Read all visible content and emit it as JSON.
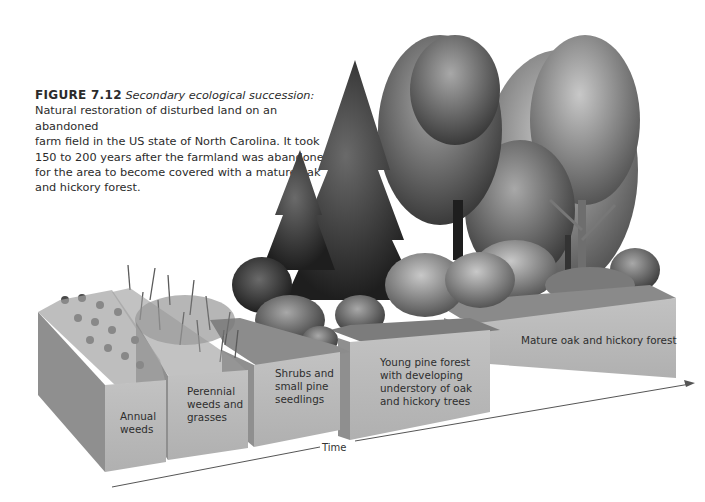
{
  "figure": {
    "label": "FIGURE 7.12",
    "title": "Secondary ecological succession:",
    "caption_lines": [
      "Natural restoration of disturbed land on an abandoned",
      "farm field in the US state of North Carolina. It took",
      "150 to 200 years after the farmland was abandoned",
      "for the area to become covered with a mature oak",
      "and hickory forest."
    ]
  },
  "stages": [
    {
      "id": "annual-weeds",
      "lines": [
        "Annual",
        "weeds"
      ]
    },
    {
      "id": "perennial-weeds",
      "lines": [
        "Perennial",
        "weeds and",
        "grasses"
      ]
    },
    {
      "id": "shrubs",
      "lines": [
        "Shrubs and",
        "small pine",
        "seedlings"
      ]
    },
    {
      "id": "young-pine",
      "lines": [
        "Young pine forest",
        "with developing",
        "understory of oak",
        "and hickory trees"
      ]
    },
    {
      "id": "mature-forest",
      "lines": [
        "Mature oak and hickory forest"
      ]
    }
  ],
  "axis": {
    "label": "Time"
  },
  "colors": {
    "block_front": "#b9b9b9",
    "block_side": "#8f8f8f",
    "block_top": "#9a9a9a",
    "foliage_dark": "#2b2b2b",
    "foliage_mid": "#5e5e5e",
    "foliage_light": "#8c8c8c",
    "arrow": "#555555"
  }
}
